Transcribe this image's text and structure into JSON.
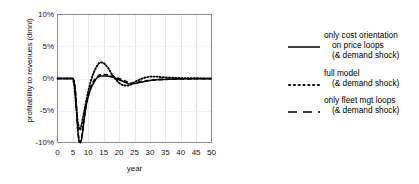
{
  "chart_data": {
    "type": "line",
    "title": "",
    "xlabel": "year",
    "ylabel": "profitability to revenues (dmnl)",
    "xlim": [
      0,
      50
    ],
    "ylim": [
      -0.1,
      0.1
    ],
    "xticks": [
      0,
      5,
      10,
      15,
      20,
      25,
      30,
      35,
      40,
      45,
      50
    ],
    "xtick_labels": [
      "0",
      "5",
      "10",
      "15",
      "20",
      "25",
      "30",
      "35",
      "40",
      "45",
      "50"
    ],
    "yticks": [
      -0.1,
      -0.05,
      0.0,
      0.05,
      0.1
    ],
    "ytick_labels": [
      "-10%",
      "-5%",
      "0%",
      "5%",
      "10%"
    ],
    "grid": "vertical-major-light",
    "legend_position": "right",
    "series": [
      {
        "name": "only cost orientation on price loops (& demand shock)",
        "style": "solid",
        "color": "#000000",
        "x": [
          0,
          1,
          2,
          3,
          4,
          5,
          5.4,
          5.8,
          6.2,
          6.6,
          7.0,
          7.4,
          7.8,
          8.2,
          8.6,
          9.0,
          9.5,
          10,
          10.5,
          11,
          11.5,
          12,
          12.5,
          13,
          13.5,
          14,
          15,
          16,
          17,
          18,
          19,
          20,
          21,
          22,
          23,
          24,
          25,
          26,
          27,
          28,
          29,
          30,
          32,
          34,
          36,
          38,
          40,
          42,
          44,
          46,
          48,
          50
        ],
        "y": [
          0.0,
          0.0,
          0.0,
          0.0,
          0.0,
          0.0,
          -0.004,
          -0.02,
          -0.05,
          -0.082,
          -0.098,
          -0.1,
          -0.096,
          -0.082,
          -0.066,
          -0.052,
          -0.038,
          -0.028,
          -0.02,
          -0.014,
          -0.009,
          -0.005,
          -0.001,
          0.002,
          0.003,
          0.004,
          0.004,
          0.004,
          0.003,
          0.002,
          0.0,
          -0.002,
          -0.004,
          -0.006,
          -0.008,
          -0.009,
          -0.008,
          -0.007,
          -0.006,
          -0.005,
          -0.004,
          -0.003,
          -0.002,
          -0.0015,
          -0.001,
          -0.0008,
          -0.0006,
          -0.0005,
          -0.0004,
          -0.0003,
          -0.0002,
          -0.0002
        ]
      },
      {
        "name": "full model (& demand shock)",
        "style": "dotted",
        "color": "#000000",
        "x": [
          0,
          1,
          2,
          3,
          4,
          5,
          5.5,
          6,
          6.5,
          7,
          7.4,
          7.8,
          8.2,
          8.6,
          9,
          9.5,
          10,
          10.5,
          11,
          11.5,
          12,
          12.5,
          13,
          13.5,
          14,
          14.5,
          15,
          15.5,
          16,
          16.5,
          17,
          17.5,
          18,
          19,
          20,
          21,
          22,
          23,
          24,
          25,
          26,
          27,
          28,
          29,
          30,
          31,
          32,
          34,
          36,
          38,
          40,
          42,
          44,
          46,
          48,
          50
        ],
        "y": [
          0.0,
          0.0,
          0.0,
          0.0,
          0.0,
          0.0,
          -0.012,
          -0.04,
          -0.066,
          -0.079,
          -0.08,
          -0.073,
          -0.063,
          -0.053,
          -0.043,
          -0.031,
          -0.02,
          -0.01,
          -0.001,
          0.006,
          0.012,
          0.017,
          0.021,
          0.024,
          0.025,
          0.025,
          0.024,
          0.022,
          0.019,
          0.016,
          0.012,
          0.008,
          0.004,
          -0.002,
          -0.007,
          -0.01,
          -0.011,
          -0.011,
          -0.009,
          -0.006,
          -0.003,
          -0.001,
          0.001,
          0.002,
          0.003,
          0.003,
          0.003,
          0.002,
          0.0015,
          0.001,
          0.0008,
          0.0005,
          0.0004,
          0.0003,
          0.0002,
          0.0002
        ]
      },
      {
        "name": "only fleet mgt loops (& demand shock)",
        "style": "dashed",
        "color": "#000000",
        "x": [
          0,
          1,
          2,
          3,
          4,
          5,
          5.4,
          5.8,
          6.2,
          6.6,
          7.0,
          7.4,
          7.8,
          8.2,
          8.6,
          9.0,
          9.5,
          10,
          10.5,
          11,
          11.5,
          12,
          12.5,
          13,
          13.5,
          14,
          14.5,
          15,
          15.5,
          16,
          16.5,
          17,
          18,
          19,
          20,
          21,
          22,
          23,
          24,
          25,
          26,
          27,
          28,
          30,
          32,
          34,
          36,
          38,
          40,
          42,
          44,
          46,
          48,
          50
        ],
        "y": [
          0.0,
          0.0,
          0.0,
          0.0,
          0.0,
          0.0,
          -0.004,
          -0.02,
          -0.05,
          -0.082,
          -0.098,
          -0.1,
          -0.094,
          -0.079,
          -0.063,
          -0.049,
          -0.035,
          -0.025,
          -0.017,
          -0.011,
          -0.006,
          -0.002,
          0.001,
          0.003,
          0.005,
          0.006,
          0.006,
          0.006,
          0.006,
          0.006,
          0.005,
          0.004,
          0.003,
          0.002,
          0.0,
          -0.002,
          -0.004,
          -0.006,
          -0.007,
          -0.007,
          -0.006,
          -0.005,
          -0.004,
          -0.003,
          -0.002,
          -0.0015,
          -0.001,
          -0.0008,
          -0.0006,
          -0.0005,
          -0.0004,
          -0.0003,
          -0.0002,
          -0.0002
        ]
      }
    ]
  },
  "legend": {
    "entries": [
      {
        "style": "solid",
        "line1": "only cost orientation",
        "line2": "on price loops",
        "line3": "(& demand shock)"
      },
      {
        "style": "dotted",
        "line1": "full model",
        "line2": "(& demand shock)",
        "line3": ""
      },
      {
        "style": "dashed",
        "line1": "only fleet mgt loops",
        "line2": "(& demand shock)",
        "line3": ""
      }
    ]
  }
}
